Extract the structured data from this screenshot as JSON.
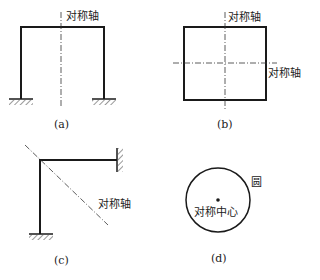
{
  "figures": [
    {
      "id": "a",
      "caption": "(a)",
      "axis_labels": [
        "对称轴"
      ],
      "description": "portal frame with fixed supports"
    },
    {
      "id": "b",
      "caption": "(b)",
      "axis_labels": [
        "对称轴",
        "对称轴"
      ],
      "description": "closed rectangular frame"
    },
    {
      "id": "c",
      "caption": "(c)",
      "axis_labels": [
        "对称轴"
      ],
      "description": "L-shaped frame with fixed supports"
    },
    {
      "id": "d",
      "caption": "(d)",
      "circle_label": "圆",
      "center_label": "对称中心",
      "description": "circle with center of symmetry"
    }
  ],
  "colors": {
    "line": "#1a1a1a",
    "background": "#ffffff"
  }
}
